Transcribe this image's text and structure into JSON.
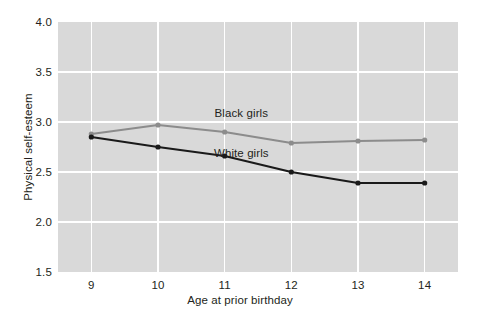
{
  "chart_data": {
    "type": "line",
    "title": "",
    "xlabel": "Age at prior birthday",
    "ylabel": "Physical self-esteem",
    "x": [
      9,
      10,
      11,
      12,
      13,
      14
    ],
    "xticklabels": [
      "9",
      "10",
      "11",
      "12",
      "13",
      "14"
    ],
    "yticklabels": [
      "4.0",
      "3.5",
      "3.0",
      "2.5",
      "2.0",
      "1.5"
    ],
    "yticks": [
      4.0,
      3.5,
      3.0,
      2.5,
      2.0,
      1.5
    ],
    "xlim": [
      8.5,
      14.5
    ],
    "ylim": [
      1.5,
      4.0
    ],
    "grid": true,
    "grid_color": "#ffffff",
    "plot_background": "#d9d9d9",
    "figure_background": "#ffffff",
    "legend_position": "inline-annotations",
    "series": [
      {
        "name": "Black girls",
        "color": "#8c8c8c",
        "marker": "circle",
        "values": [
          2.88,
          2.97,
          2.9,
          2.79,
          2.81,
          2.82
        ],
        "label_x": 11.25,
        "label_y": 3.08
      },
      {
        "name": "White girls",
        "color": "#1a1a1a",
        "marker": "circle",
        "values": [
          2.85,
          2.75,
          2.66,
          2.5,
          2.39,
          2.39
        ],
        "label_x": 11.25,
        "label_y": 2.68
      }
    ]
  }
}
